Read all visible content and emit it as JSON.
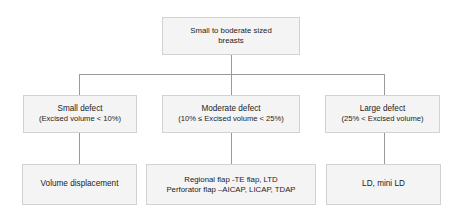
{
  "diagram": {
    "line_color": "#9a9a9a",
    "box_fill": "#f4f4f4",
    "box_border": "#d2d2d2",
    "text_color": "#1c1c1c",
    "nodes": {
      "root": {
        "line1": "Small to boderate sized",
        "line2": "breasts"
      },
      "small_defect": {
        "line1": "Small defect",
        "line2": "(Excised volume < 10%)"
      },
      "moderate_defect": {
        "line1": "Moderate defect",
        "line2": "(10% ≤ Excised volume < 25%)"
      },
      "large_defect": {
        "line1": "Large defect",
        "line2": "(25% < Excised volume)"
      },
      "small_treatment": {
        "line1": "Volume displacement",
        "line2": ""
      },
      "moderate_treatment": {
        "line1": "Regional flap -TE flap, LTD",
        "line2": "Perforator flap –AICAP, LICAP, TDAP"
      },
      "large_treatment": {
        "line1": "LD, mini LD",
        "line2": ""
      }
    }
  }
}
